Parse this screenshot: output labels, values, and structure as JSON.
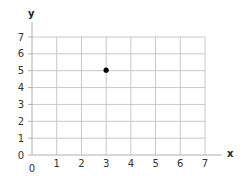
{
  "chart_data": {
    "type": "scatter",
    "title": "",
    "xlabel": "x",
    "ylabel": "y",
    "xlim": [
      0,
      7
    ],
    "ylim": [
      0,
      7
    ],
    "grid": true,
    "legend": null,
    "x_ticks": [
      "0",
      "1",
      "2",
      "3",
      "4",
      "5",
      "6",
      "7"
    ],
    "y_ticks": [
      "0",
      "1",
      "2",
      "3",
      "4",
      "5",
      "6",
      "7"
    ],
    "series": [
      {
        "name": "point",
        "points": [
          {
            "x": 3,
            "y": 5
          }
        ],
        "color": "#000000"
      }
    ]
  },
  "colors": {
    "grid": "#c8c8c8",
    "axis": "#b0b0b0",
    "point": "#000000",
    "text": "#333333"
  }
}
